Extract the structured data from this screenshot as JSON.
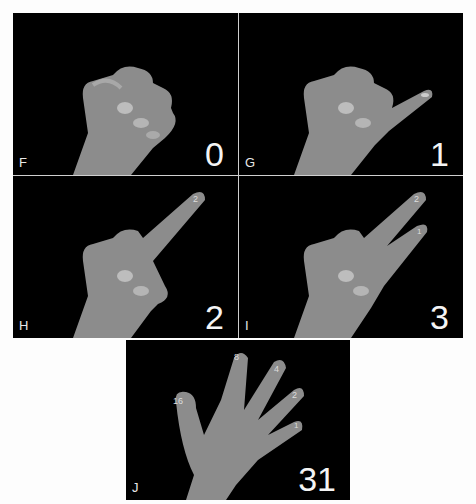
{
  "figure": {
    "colors": {
      "background": "#fdfdfd",
      "panel": "#000000",
      "skin": "#8f8f8f",
      "label": "#e8e8e8"
    },
    "panels": [
      {
        "letter": "F",
        "value": "0",
        "raised_fingers": []
      },
      {
        "letter": "G",
        "value": "1",
        "raised_fingers": [
          "pinky"
        ],
        "finger_labels": [
          "1"
        ]
      },
      {
        "letter": "H",
        "value": "2",
        "raised_fingers": [
          "ring"
        ],
        "finger_labels": [
          "2"
        ]
      },
      {
        "letter": "I",
        "value": "3",
        "raised_fingers": [
          "ring",
          "pinky"
        ],
        "finger_labels": [
          "2",
          "1"
        ]
      },
      {
        "letter": "J",
        "value": "31",
        "raised_fingers": [
          "thumb",
          "index",
          "middle",
          "ring",
          "pinky"
        ],
        "finger_labels": [
          "16",
          "8",
          "4",
          "2",
          "1"
        ]
      }
    ]
  }
}
